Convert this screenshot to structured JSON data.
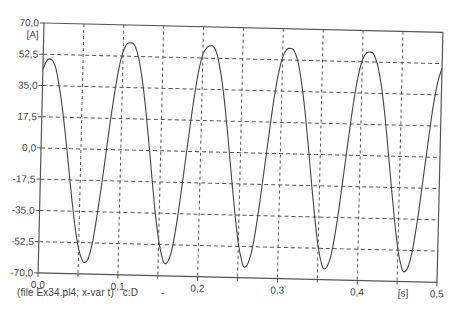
{
  "chart_data": {
    "type": "line",
    "title": "",
    "xlabel": "[s]",
    "ylabel": "[A]",
    "xlim": [
      0.0,
      0.5
    ],
    "ylim": [
      -70.0,
      70.0
    ],
    "x_ticks": [
      "0,0",
      "0,1",
      "0,2",
      "0,3",
      "0,4",
      "0,5"
    ],
    "y_ticks": [
      "70,0",
      "52,5",
      "35,0",
      "17,5",
      "0,0",
      "-17,5",
      "-35,0",
      "-52,5",
      "-70,0"
    ],
    "grid": true,
    "grid_style": "dashed",
    "x_minor_grid": [
      0.05,
      0.15,
      0.25,
      0.35,
      0.45
    ],
    "legend": [],
    "series": [
      {
        "name": "c:D",
        "color": "#444444",
        "x": [
          0.0,
          0.004,
          0.008,
          0.012,
          0.016,
          0.02,
          0.025,
          0.03,
          0.035,
          0.04,
          0.045,
          0.05,
          0.055,
          0.058,
          0.062,
          0.066,
          0.07,
          0.075,
          0.08,
          0.085,
          0.09,
          0.095,
          0.1,
          0.105,
          0.11,
          0.113,
          0.116,
          0.12,
          0.125,
          0.13,
          0.135,
          0.14,
          0.145,
          0.15,
          0.155,
          0.158,
          0.162,
          0.166,
          0.17,
          0.175,
          0.18,
          0.185,
          0.19,
          0.195,
          0.2,
          0.205,
          0.21,
          0.213,
          0.216,
          0.22,
          0.225,
          0.23,
          0.235,
          0.24,
          0.245,
          0.25,
          0.255,
          0.258,
          0.262,
          0.266,
          0.27,
          0.275,
          0.28,
          0.285,
          0.29,
          0.295,
          0.3,
          0.305,
          0.31,
          0.313,
          0.316,
          0.32,
          0.325,
          0.33,
          0.335,
          0.34,
          0.345,
          0.35,
          0.355,
          0.358,
          0.362,
          0.366,
          0.37,
          0.375,
          0.38,
          0.385,
          0.39,
          0.395,
          0.4,
          0.405,
          0.41,
          0.413,
          0.416,
          0.42,
          0.425,
          0.43,
          0.435,
          0.44,
          0.445,
          0.45,
          0.455,
          0.458,
          0.462,
          0.466,
          0.47,
          0.475,
          0.48,
          0.485,
          0.49,
          0.495,
          0.5
        ],
        "y": [
          44.0,
          48.5,
          50.0,
          49.0,
          45.0,
          37.0,
          24.0,
          8.0,
          -10.0,
          -28.0,
          -44.0,
          -56.0,
          -62.5,
          -63.5,
          -61.5,
          -55.0,
          -44.0,
          -27.0,
          -8.0,
          12.0,
          30.0,
          45.0,
          55.0,
          59.5,
          60.0,
          59.5,
          57.0,
          51.0,
          39.0,
          23.0,
          4.0,
          -16.0,
          -35.0,
          -50.0,
          -60.0,
          -63.0,
          -62.0,
          -57.0,
          -47.0,
          -30.0,
          -10.0,
          10.0,
          29.0,
          44.5,
          54.5,
          58.5,
          59.5,
          59.0,
          57.0,
          51.0,
          39.0,
          23.0,
          4.0,
          -16.0,
          -35.0,
          -51.0,
          -61.0,
          -64.0,
          -62.5,
          -57.0,
          -47.0,
          -30.0,
          -10.0,
          10.0,
          29.0,
          44.0,
          54.0,
          58.5,
          59.0,
          58.5,
          56.0,
          50.5,
          38.5,
          22.5,
          3.5,
          -16.5,
          -35.5,
          -51.5,
          -61.5,
          -64.0,
          -62.5,
          -57.0,
          -47.0,
          -30.0,
          -10.0,
          10.0,
          29.0,
          44.0,
          53.5,
          57.5,
          58.0,
          57.5,
          55.0,
          49.5,
          38.0,
          22.0,
          3.0,
          -17.0,
          -36.0,
          -52.0,
          -62.0,
          -64.5,
          -63.0,
          -57.5,
          -47.5,
          -30.5,
          -10.5,
          9.5,
          28.5,
          42.0,
          50.0
        ]
      }
    ]
  },
  "footer": {
    "file_info": "(file Ex34.pl4; x-var t)",
    "variable": "c:D",
    "dash": "-"
  }
}
